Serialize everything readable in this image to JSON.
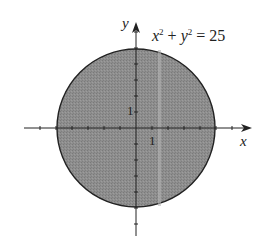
{
  "figure": {
    "equation": {
      "x": "x",
      "y": "y",
      "exp": "2",
      "plus": " + ",
      "eq": " = 25"
    },
    "axis_labels": {
      "x": "x",
      "y": "y"
    },
    "tick_labels": {
      "x_one": "1",
      "y_one": "1"
    },
    "circle": {
      "center": [
        0,
        0
      ],
      "radius": 5,
      "fill": "#8c8c8c",
      "stroke": "#222222"
    },
    "axis_color": "#222222",
    "unit_px": 16
  }
}
